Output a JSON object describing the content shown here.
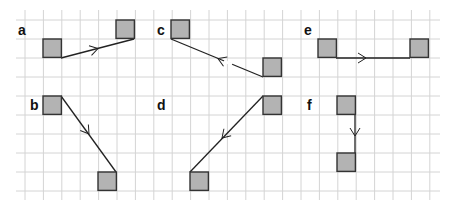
{
  "figure": {
    "width": 452,
    "height": 209,
    "grid": {
      "x0": 16,
      "x1": 440,
      "y0": 10,
      "y1": 200,
      "vlines": [
        25,
        43.4,
        61.8,
        80.2,
        98.6,
        117,
        135.4,
        153.8,
        172.2,
        190.6,
        209,
        227.4,
        245.8,
        264.2,
        282.6,
        301,
        319.4,
        337.8,
        356.2,
        374.6,
        393,
        411.4,
        429.8
      ],
      "hlines": [
        20,
        39,
        58,
        77,
        96,
        115,
        134,
        153,
        172,
        191
      ],
      "color": "#d4d4d4"
    },
    "colors": {
      "square_fill": "#b3b3b3",
      "square_stroke": "#333333",
      "line": "#222222",
      "label": "#111111"
    },
    "panels": [
      {
        "label": "a",
        "label_pos": [
          18,
          35
        ],
        "squares": [
          [
            43,
            39
          ],
          [
            116,
            20
          ]
        ],
        "line": [
          [
            61,
            58
          ],
          [
            134,
            39
          ]
        ],
        "arrow": {
          "at": [
            98,
            48.5
          ],
          "angle": -14.6
        }
      },
      {
        "label": "c",
        "label_pos": [
          157,
          35
        ],
        "squares": [
          [
            171,
            20
          ],
          [
            263,
            58
          ]
        ],
        "line": [
          [
            171,
            39
          ],
          [
            263,
            77
          ]
        ],
        "arrow": {
          "at": [
            218,
            58.5
          ],
          "angle": 202.4
        },
        "gap": [
          [
            224,
            61
          ],
          [
            232,
            64.5
          ]
        ]
      },
      {
        "label": "e",
        "label_pos": [
          304,
          35
        ],
        "squares": [
          [
            318,
            39
          ],
          [
            410,
            39
          ]
        ],
        "line": [
          [
            336,
            58
          ],
          [
            410,
            58
          ]
        ],
        "arrow": {
          "at": [
            366,
            58
          ],
          "angle": 0
        }
      },
      {
        "label": "b",
        "label_pos": [
          30,
          110
        ],
        "squares": [
          [
            43,
            96
          ],
          [
            98,
            172
          ]
        ],
        "line": [
          [
            61,
            96
          ],
          [
            116,
            172
          ]
        ],
        "arrow": {
          "at": [
            89,
            134
          ],
          "angle": 54.1
        }
      },
      {
        "label": "d",
        "label_pos": [
          157,
          110
        ],
        "squares": [
          [
            263,
            96
          ],
          [
            190,
            172
          ]
        ],
        "line": [
          [
            263,
            96
          ],
          [
            190,
            172
          ]
        ],
        "arrow": {
          "at": [
            222,
            138
          ],
          "angle": 133.8
        }
      },
      {
        "label": "f",
        "label_pos": [
          307,
          110
        ],
        "squares": [
          [
            337,
            96
          ],
          [
            337,
            153
          ]
        ],
        "line": [
          [
            355,
            115
          ],
          [
            355,
            153
          ]
        ],
        "arrow": {
          "at": [
            355,
            136
          ],
          "angle": 90
        }
      }
    ],
    "square_size": 18.4
  }
}
